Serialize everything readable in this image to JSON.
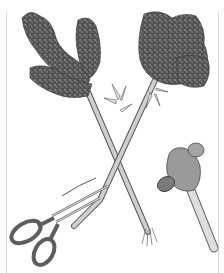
{
  "illustration": {
    "subject": "pencil drawing of two crossed lilac branches with scissors and a ball-peen hammer",
    "elements": [
      "lilac-branch-left",
      "lilac-branch-right",
      "scissors",
      "hammer",
      "split-stem-end"
    ],
    "colors": {
      "background": "#ffffff",
      "flower_dark": "#3a3a3a",
      "flower_mid": "#6e6e6e",
      "flower_light": "#a8a8a8",
      "stem": "#c8c8c8",
      "stem_outline": "#555555",
      "scissor_handle": "#6a6a6a",
      "hammer_head": "#8a8a8a",
      "hammer_handle": "#d6d6d6",
      "frame_line": "#d8d8d8"
    }
  }
}
